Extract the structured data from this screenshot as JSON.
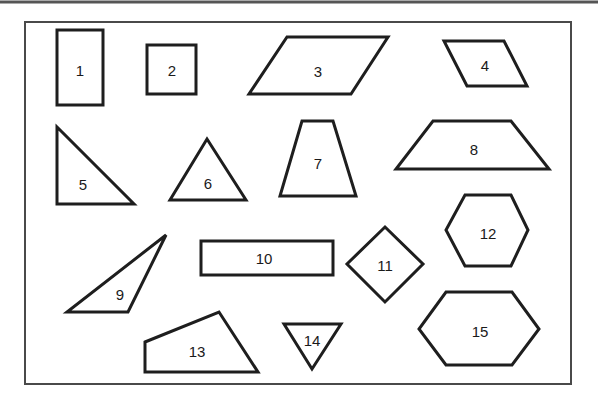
{
  "diagram": {
    "colors": {
      "stroke": "#1e1e1e",
      "frame": "#4a4a4a",
      "top_rule": "#555555",
      "background": "#ffffff"
    },
    "shapes": [
      {
        "id": "1",
        "label": "1",
        "kind": "rectangle",
        "points": "57,30 103,30 103,105 57,105",
        "label_pos": [
          80,
          70
        ]
      },
      {
        "id": "2",
        "label": "2",
        "kind": "square",
        "points": "147,45 196,45 196,94 147,94",
        "label_pos": [
          172,
          70
        ]
      },
      {
        "id": "3",
        "label": "3",
        "kind": "parallelogram",
        "points": "287,37 388,37 351,94 249,94",
        "label_pos": [
          318,
          71
        ]
      },
      {
        "id": "4",
        "label": "4",
        "kind": "parallelogram",
        "points": "444,41 504,41 527,86 467,86",
        "label_pos": [
          485,
          65
        ]
      },
      {
        "id": "5",
        "label": "5",
        "kind": "right-triangle",
        "points": "57,127 134,204 57,204",
        "label_pos": [
          83,
          184
        ]
      },
      {
        "id": "6",
        "label": "6",
        "kind": "triangle",
        "points": "207,139 246,200 170,200",
        "label_pos": [
          208,
          183
        ]
      },
      {
        "id": "7",
        "label": "7",
        "kind": "trapezoid",
        "points": "302,121 333,121 356,196 280,196",
        "label_pos": [
          318,
          163
        ]
      },
      {
        "id": "8",
        "label": "8",
        "kind": "trapezoid",
        "points": "433,121 511,121 549,169 396,169",
        "label_pos": [
          474,
          149
        ]
      },
      {
        "id": "9",
        "label": "9",
        "kind": "obtuse-triangle",
        "points": "166,235 128,312 67,312",
        "label_pos": [
          120,
          294
        ]
      },
      {
        "id": "10",
        "label": "10",
        "kind": "rectangle",
        "points": "201,241 333,241 333,275 201,275",
        "label_pos": [
          264,
          258
        ]
      },
      {
        "id": "11",
        "label": "11",
        "kind": "rhombus",
        "points": "385,227 423,264 385,302 347,264",
        "label_pos": [
          385,
          265
        ]
      },
      {
        "id": "12",
        "label": "12",
        "kind": "hexagon",
        "points": "465,195 511,195 528,230 511,266 465,266 446,230",
        "label_pos": [
          488,
          233
        ]
      },
      {
        "id": "13",
        "label": "13",
        "kind": "quadrilateral",
        "points": "145,342 219,312 258,372 145,372",
        "label_pos": [
          197,
          351
        ]
      },
      {
        "id": "14",
        "label": "14",
        "kind": "inverted-triangle",
        "points": "284,324 341,324 312,369",
        "label_pos": [
          312,
          340
        ]
      },
      {
        "id": "15",
        "label": "15",
        "kind": "hexagon",
        "points": "446,292 512,292 539,329 512,365 446,365 419,329",
        "label_pos": [
          480,
          331
        ]
      }
    ]
  }
}
